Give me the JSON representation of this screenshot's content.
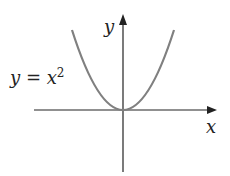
{
  "diagram": {
    "equation_label": {
      "lhs": "y",
      "op": " = ",
      "base": "x",
      "exp": "2"
    },
    "x_axis_label": "x",
    "y_axis_label": "y",
    "curve": {
      "type": "parabola",
      "function": "y = x^2",
      "color": "#808080"
    },
    "axis_color": "#222222"
  }
}
